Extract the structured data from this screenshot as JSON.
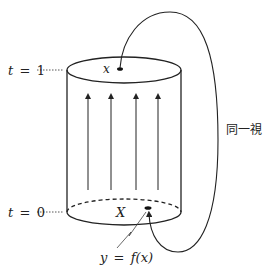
{
  "diagram": {
    "type": "mapping-cylinder",
    "labels": {
      "t_top": {
        "var": "t",
        "eq": "=",
        "val": "1"
      },
      "t_bottom": {
        "var": "t",
        "eq": "=",
        "val": "0"
      },
      "top_point": "x",
      "base_space": "X",
      "identification": "同一視",
      "map_label": {
        "lhs": "y",
        "eq": "=",
        "rhs": "f(x)"
      }
    },
    "flow_arrows": 4,
    "colors": {
      "stroke": "#222222",
      "background": "#ffffff"
    }
  }
}
